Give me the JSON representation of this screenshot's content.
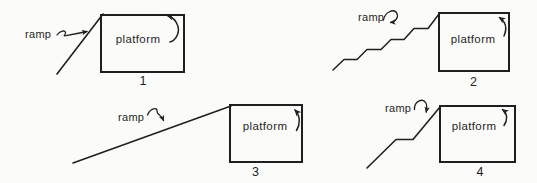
{
  "theme": {
    "bg": "#fbfbf9",
    "ink": "#1f1f1f"
  },
  "diagrams": [
    {
      "number": "1",
      "ramp_label": "ramp",
      "platform_label": "platform",
      "ramp_shape": "steep straight ramp"
    },
    {
      "number": "2",
      "ramp_label": "ramp",
      "platform_label": "platform",
      "ramp_shape": "stepped ramp"
    },
    {
      "number": "3",
      "ramp_label": "ramp",
      "platform_label": "platform",
      "ramp_shape": "long shallow straight ramp"
    },
    {
      "number": "4",
      "ramp_label": "ramp",
      "platform_label": "platform",
      "ramp_shape": "ramp with level landing"
    }
  ]
}
